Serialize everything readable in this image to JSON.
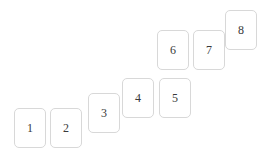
{
  "scene": {
    "width": 268,
    "height": 157,
    "background_color": "#ffffff",
    "card_border_color": "#d8d8d8",
    "card_fill_color": "#ffffff",
    "label_color": "#3a3a3a"
  },
  "cards": [
    {
      "label": "1",
      "x": 14,
      "y": 108
    },
    {
      "label": "2",
      "x": 50,
      "y": 108
    },
    {
      "label": "3",
      "x": 88,
      "y": 93
    },
    {
      "label": "4",
      "x": 122,
      "y": 78
    },
    {
      "label": "5",
      "x": 159,
      "y": 78
    },
    {
      "label": "6",
      "x": 157,
      "y": 30
    },
    {
      "label": "7",
      "x": 193,
      "y": 30
    },
    {
      "label": "8",
      "x": 225,
      "y": 10
    }
  ]
}
